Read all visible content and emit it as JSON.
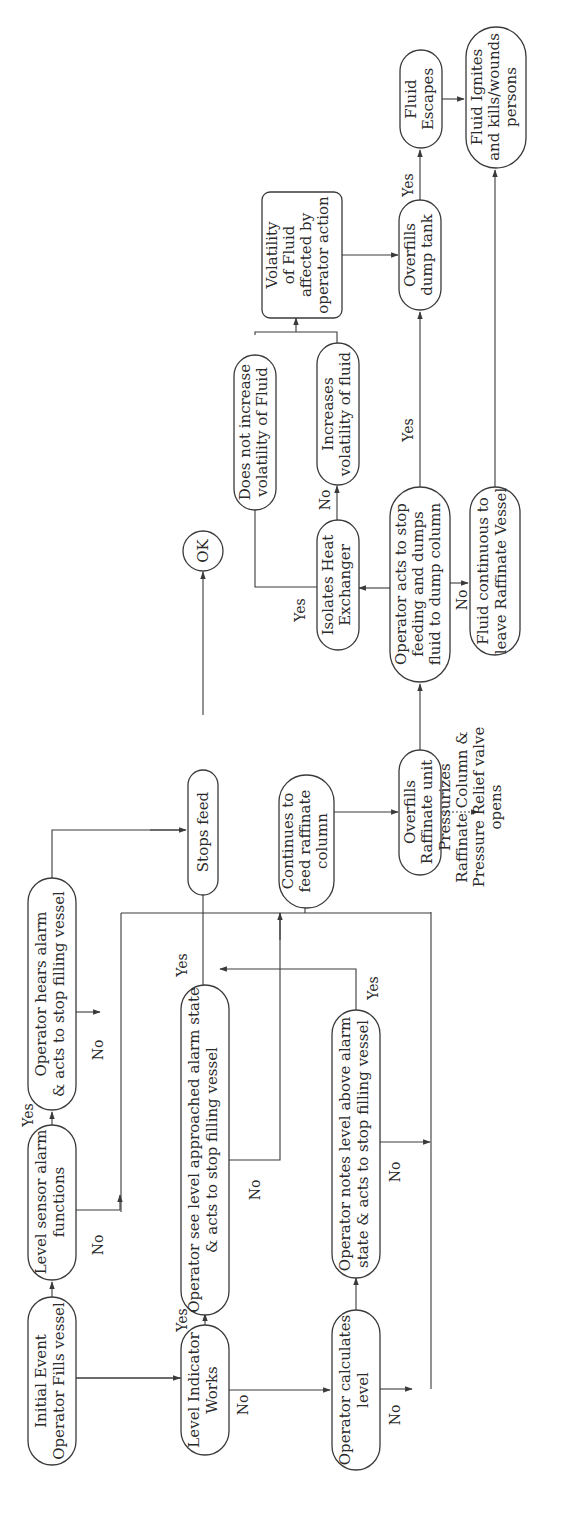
{
  "diagram": {
    "type": "event-tree flowchart",
    "orientation": "rotated 90 degrees counter-clockwise",
    "nodes": {
      "initial_event": {
        "lines": [
          "Initial Event",
          "Operator Fills vessel"
        ]
      },
      "level_sensor": {
        "lines": [
          "Level sensor alarm",
          "functions"
        ]
      },
      "operator_hears": {
        "lines": [
          "Operator hears alarm",
          "& acts to stop filling vessel"
        ]
      },
      "level_indicator": {
        "lines": [
          "Level Indicator",
          "Works"
        ]
      },
      "operator_sees": {
        "lines": [
          "Operator see level approached alarm state",
          "& acts to stop filling vessel"
        ]
      },
      "operator_calculates": {
        "lines": [
          "Operator calculates",
          "level"
        ]
      },
      "operator_notes": {
        "lines": [
          "Operator notes level above alarm",
          "state & acts to stop filling vessel"
        ]
      },
      "stops_feed": {
        "lines": [
          "Stops feed"
        ]
      },
      "ok": {
        "lines": [
          "OK"
        ]
      },
      "continues_feed": {
        "lines": [
          "Continues to",
          "feed raffinate",
          "column"
        ]
      },
      "overfills_raffinate": {
        "lines": [
          "Overfills",
          "Raffinate unit"
        ]
      },
      "pressurizes": {
        "lines": [
          "Pressurizes",
          "Raffinate Column &",
          "Pressure Relief valve",
          "opens"
        ]
      },
      "operator_acts_dump": {
        "lines": [
          "Operator acts to stop",
          "feeding and dumps",
          "fluid to dump column"
        ]
      },
      "isolates_hx": {
        "lines": [
          "Isolates Heat",
          "Exchanger"
        ]
      },
      "does_not_increase": {
        "lines": [
          "Does not increase",
          "volatility of Fluid"
        ]
      },
      "increases_volatility": {
        "lines": [
          "Increases",
          "volatility of fluid"
        ]
      },
      "volatility_affected": {
        "lines": [
          "Volatility",
          "of Fluid",
          "affected by",
          "operator action"
        ]
      },
      "fluid_continuous": {
        "lines": [
          "Fluid continuous to",
          "leave Raffinate Vessel"
        ]
      },
      "overfills_dump": {
        "lines": [
          "Overfills",
          "dump tank"
        ]
      },
      "fluid_escapes": {
        "lines": [
          "Fluid",
          "Escapes"
        ]
      },
      "fluid_ignites": {
        "lines": [
          "Fluid Ignites",
          "and kills/wounds",
          "persons"
        ]
      }
    },
    "edge_labels": {
      "yes": "Yes",
      "no": "No"
    }
  }
}
